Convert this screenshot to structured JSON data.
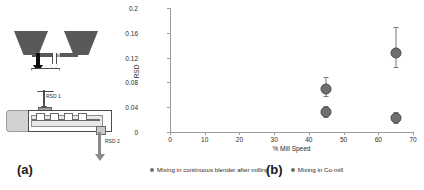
{
  "figure": {
    "panel_a_label": "(a)",
    "panel_b_label": "(b)"
  },
  "schematic": {
    "air_label": "air",
    "rsd1_label": "RSD 1",
    "rsd2_label": "RSD 2",
    "parts": {
      "hopper_left": "hopper-left",
      "hopper_right": "hopper-right",
      "co_mill": "co-mill-funnel",
      "blender": "continuous-blender",
      "motor": "blender-motor",
      "outlet": "blender-outlet"
    }
  },
  "chart_data": {
    "type": "scatter",
    "title": "",
    "xlabel": "% Mill Speed",
    "ylabel": "RSD",
    "xlim": [
      0,
      70
    ],
    "ylim": [
      0,
      0.2
    ],
    "xticks": [
      0,
      10,
      20,
      30,
      40,
      50,
      60,
      70
    ],
    "xtick_labels": [
      "0",
      "10",
      "20",
      "30",
      "40",
      "50",
      "60",
      "70"
    ],
    "yticks": [
      0,
      0.04,
      0.08,
      0.12,
      0.16,
      0.2
    ],
    "ytick_labels": [
      "0",
      "0.04",
      "0.08",
      "0.12",
      "0.16",
      "0.2"
    ],
    "grid": false,
    "legend_position": "below",
    "marker_color": "#6f6f6f",
    "errorbar_color": "#7a7a7a",
    "series": [
      {
        "name": "Mixing in continuous blender after milling",
        "points": [
          {
            "x": 45,
            "y": 0.07,
            "yerr_low": 0.058,
            "yerr_high": 0.089
          },
          {
            "x": 65,
            "y": 0.128,
            "yerr_low": 0.105,
            "yerr_high": 0.17
          }
        ]
      },
      {
        "name": "Mixing in Co-mill",
        "points": [
          {
            "x": 45,
            "y": 0.032,
            "yerr_low": 0.024,
            "yerr_high": 0.042
          },
          {
            "x": 65,
            "y": 0.022,
            "yerr_low": 0.014,
            "yerr_high": 0.032
          }
        ]
      }
    ]
  }
}
